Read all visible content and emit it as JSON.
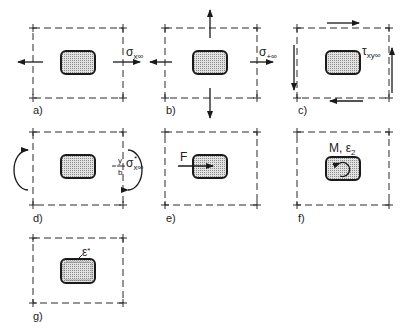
{
  "panels": [
    {
      "id": "a",
      "label": "a)",
      "annotation": {
        "symbol": "σ",
        "subscript": "x∞"
      }
    },
    {
      "id": "b",
      "label": "b)",
      "annotation": {
        "symbol": "σ",
        "subscript": "+∞"
      }
    },
    {
      "id": "c",
      "label": "c)",
      "annotation": {
        "symbol": "τ",
        "subscript": "xy∞"
      }
    },
    {
      "id": "d",
      "label": "d)",
      "annotation": {
        "prefix_num": "y",
        "prefix_den": "b",
        "symbol": "σ",
        "subscript": "x∞",
        "superscript": "*"
      }
    },
    {
      "id": "e",
      "label": "e)",
      "annotation": {
        "symbol": "F"
      }
    },
    {
      "id": "f",
      "label": "f)",
      "annotation": {
        "symbol": "M, ε",
        "subscript": "2"
      }
    },
    {
      "id": "g",
      "label": "g)",
      "annotation": {
        "symbol": "ε",
        "superscript": "*"
      }
    }
  ],
  "colors": {
    "line": "#1a1a1a",
    "fill_dots": "#9a9a9a",
    "background": "#ffffff"
  }
}
